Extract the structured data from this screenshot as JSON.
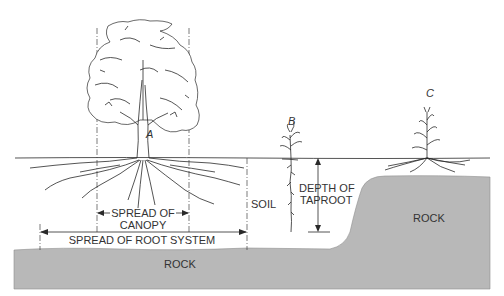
{
  "figure": {
    "type": "illustration"
  },
  "plants": [
    {
      "id": "A",
      "label": "A",
      "kind": "tree"
    },
    {
      "id": "B",
      "label": "B",
      "kind": "taprooted plant"
    },
    {
      "id": "C",
      "label": "C",
      "kind": "shallow-rooted plant (corn)"
    }
  ],
  "labels": {
    "spread_of_canopy_line1": "SPREAD OF",
    "spread_of_canopy_line2": "CANOPY",
    "spread_of_root_system": "SPREAD OF ROOT SYSTEM",
    "soil": "SOIL",
    "depth_of_taproot_line1": "DEPTH OF",
    "depth_of_taproot_line2": "TAPROOT",
    "rock_left": "ROCK",
    "rock_right": "ROCK"
  },
  "colors": {
    "rock_fill": "#b8b8b8",
    "line": "#2a2a2a",
    "background": "#ffffff"
  }
}
